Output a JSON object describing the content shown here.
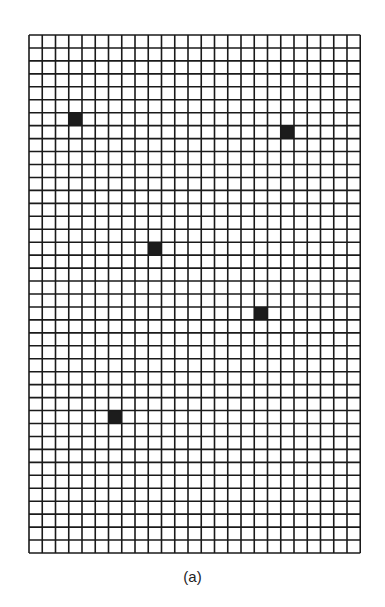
{
  "figure": {
    "caption": "(a)",
    "grid": {
      "columns": 25,
      "rows": 40,
      "cell_width": 13.25,
      "cell_height": 12.95,
      "line_color": "#1a1a1a",
      "fill_color": "#ffffff",
      "marked_color": "#1c1c1c",
      "marked_cells": [
        {
          "col": 3,
          "row": 6
        },
        {
          "col": 19,
          "row": 7
        },
        {
          "col": 9,
          "row": 16
        },
        {
          "col": 17,
          "row": 21
        },
        {
          "col": 6,
          "row": 29
        }
      ]
    }
  }
}
